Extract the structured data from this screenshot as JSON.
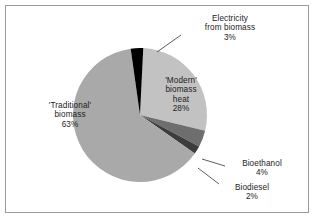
{
  "figure": {
    "background_color": "#ffffff",
    "border_color": "#9a9a9a"
  },
  "chart_data": {
    "type": "pie",
    "title": "",
    "subtitle": "",
    "xlabel": "",
    "ylabel": "",
    "legend_position": "none",
    "grid": false,
    "units": "percent",
    "total": 100,
    "start_angle_deg": -8,
    "direction": "clockwise",
    "categories": [
      "'Modern' biomass heat",
      "Bioethanol",
      "Biodiesel",
      "'Traditional' biomass",
      "Electricity from biomass"
    ],
    "values": [
      28,
      4,
      2,
      63,
      3
    ],
    "colors": [
      "#c2c2c2",
      "#6e6e6e",
      "#3c3c3c",
      "#a9a9a9",
      "#000000"
    ],
    "slices": [
      {
        "name": "'Modern' biomass heat",
        "value": 28,
        "value_label": "28%",
        "color": "#c2c2c2",
        "label_placement": "inside"
      },
      {
        "name": "Bioethanol",
        "value": 4,
        "value_label": "4%",
        "color": "#6e6e6e",
        "label_placement": "outside"
      },
      {
        "name": "Biodiesel",
        "value": 2,
        "value_label": "2%",
        "color": "#3c3c3c",
        "label_placement": "outside"
      },
      {
        "name": "'Traditional' biomass",
        "value": 63,
        "value_label": "63%",
        "color": "#a9a9a9",
        "label_placement": "inside"
      },
      {
        "name": "Electricity from biomass",
        "value": 3,
        "value_label": "3%",
        "color": "#000000",
        "label_placement": "outside"
      }
    ]
  },
  "labels": {
    "traditional": {
      "line1": "'Traditional'",
      "line2": "biomass",
      "line3": "63%"
    },
    "modern": {
      "line1": "'Modern'",
      "line2": "biomass",
      "line3": "heat",
      "line4": "28%"
    },
    "electricity": {
      "line1": "Electricity",
      "line2": "from biomass",
      "line3": "3%"
    },
    "bioethanol": {
      "line1": "Bioethanol",
      "line2": "4%"
    },
    "biodiesel": {
      "line1": "Biodiesel",
      "line2": "2%"
    }
  }
}
